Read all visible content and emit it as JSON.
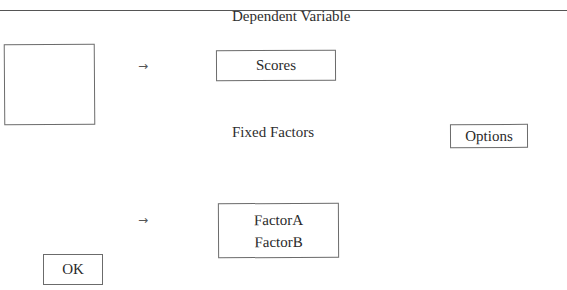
{
  "dialog": {
    "dependent_variable_label": "Dependent Variable",
    "fixed_factors_label": "Fixed Factors",
    "source_variables": [],
    "dependent_variable": {
      "value": "Scores"
    },
    "fixed_factors": {
      "items": [
        "FactorA",
        "FactorB"
      ]
    },
    "buttons": {
      "options": "Options",
      "ok": "OK"
    },
    "icons": {
      "move_to_dependent": "→",
      "move_to_factors": "→"
    }
  }
}
